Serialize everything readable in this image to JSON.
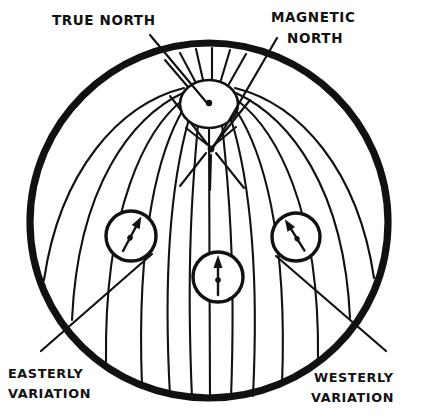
{
  "figure": {
    "name": "magnetic-variation-globe-diagram",
    "background_color": "#ffffff",
    "ink_color": "#111111"
  },
  "labels": {
    "true_north": {
      "text": "TRUE NORTH",
      "lines": [
        "TRUE NORTH"
      ],
      "position": "top-left"
    },
    "magnetic_north": {
      "text": "MAGNETIC NORTH",
      "lines": [
        "MAGNETIC",
        "NORTH"
      ],
      "position": "top-right"
    },
    "easterly_variation": {
      "text": "EASTERLY VARIATION",
      "lines": [
        "EASTERLY",
        "VARIATION"
      ],
      "position": "bottom-left"
    },
    "westerly_variation": {
      "text": "WESTERLY VARIATION",
      "lines": [
        "WESTERLY",
        "VARIATION"
      ],
      "position": "bottom-right"
    }
  },
  "globe": {
    "center_x": 209,
    "center_y": 222,
    "radius": 179,
    "outline_width": 7,
    "meridian_count": 17
  },
  "poles": {
    "true_north": {
      "label": "true-north-pole-dot",
      "cx": 209,
      "cy": 103,
      "dot_radius": 3.2,
      "cap_ellipse_rx": 29,
      "cap_ellipse_ry": 24
    },
    "magnetic_north": {
      "label": "magnetic-north-pole-dot",
      "cx": 211,
      "cy": 149,
      "dot_radius": 3.4
    }
  },
  "compasses": [
    {
      "name": "compass-easterly",
      "cx": 131,
      "cy": 236,
      "radius": 25,
      "needle_angle_deg": 28,
      "needle_direction": "northeast",
      "variation": "easterly"
    },
    {
      "name": "compass-center",
      "cx": 218,
      "cy": 277,
      "radius": 25,
      "needle_angle_deg": 0,
      "needle_direction": "north",
      "variation": "none"
    },
    {
      "name": "compass-westerly",
      "cx": 296,
      "cy": 237,
      "radius": 24,
      "needle_angle_deg": -30,
      "needle_direction": "northwest",
      "variation": "westerly"
    }
  ]
}
